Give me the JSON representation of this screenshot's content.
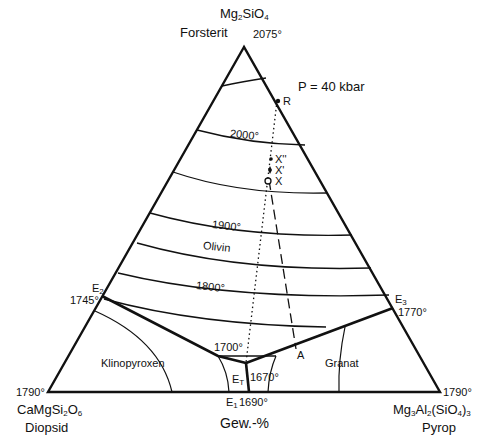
{
  "diagram": {
    "type": "ternary-phase-diagram",
    "pressure_label": "P = 40 kbar",
    "units_label": "Gew.-%",
    "vertices": {
      "top": {
        "formula_base": "Mg",
        "formula": "Mg2SiO4",
        "name": "Forsterit",
        "temp": "2075°"
      },
      "left": {
        "formula": "CaMgSi2O6",
        "name": "Diopsid",
        "temp": "1790°"
      },
      "right": {
        "formula": "Mg3Al2(SiO4)3",
        "name": "Pyrop",
        "temp": "1790°"
      }
    },
    "eutectics": {
      "E2": {
        "label": "E",
        "sub": "2",
        "temp": "1745°"
      },
      "E3": {
        "label": "E",
        "sub": "3",
        "temp": "1770°"
      },
      "ET": {
        "label": "E",
        "sub": "T",
        "temp": "1670°"
      },
      "E1": {
        "label": "E",
        "sub": "1",
        "temp": "1690°"
      }
    },
    "isotherms": [
      "2000°",
      "1900°",
      "1800°",
      "1700°"
    ],
    "fields": [
      "Olivin",
      "Klinopyroxen",
      "Granat"
    ],
    "points": [
      "R",
      "X''",
      "X'",
      "X",
      "A"
    ]
  }
}
